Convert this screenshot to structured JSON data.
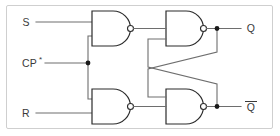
{
  "figure": {
    "type": "logic-circuit-diagram",
    "border_color": "#cfcfcf",
    "wire_color": "#6e6e6e",
    "gate_outline_color": "#2b2b2b",
    "background_color": "#ffffff"
  },
  "inputs": [
    {
      "id": "s",
      "label": "S",
      "x": 26,
      "y": 22
    },
    {
      "id": "cp",
      "label": "CP",
      "suffix": "*",
      "x": 22,
      "y": 65
    },
    {
      "id": "r",
      "label": "R",
      "x": 26,
      "y": 109
    }
  ],
  "outputs": [
    {
      "id": "q",
      "label": "Q",
      "overline": false,
      "x": 251,
      "y": 23
    },
    {
      "id": "qbar",
      "label": "Q",
      "overline": true,
      "x": 251,
      "y": 110
    }
  ],
  "gates": [
    {
      "id": "nand1",
      "type": "NAND",
      "label": "",
      "role": "set-input-gate",
      "x": 92,
      "y": 10
    },
    {
      "id": "nand2",
      "type": "NAND",
      "label": "",
      "role": "reset-input-gate",
      "x": 92,
      "y": 93
    },
    {
      "id": "nand3",
      "type": "NAND",
      "label": "",
      "role": "q-output-gate",
      "x": 166,
      "y": 10
    },
    {
      "id": "nand4",
      "type": "NAND",
      "label": "",
      "role": "qbar-output-gate",
      "x": 166,
      "y": 93
    }
  ],
  "junctions": [
    {
      "id": "cp-branch",
      "x": 88,
      "y": 63
    },
    {
      "id": "q-tap",
      "x": 217,
      "y": 24
    },
    {
      "id": "qbar-tap",
      "x": 217,
      "y": 110
    }
  ],
  "nets": [
    {
      "id": "s-to-nand1",
      "from": "S",
      "to": "NAND1 input A"
    },
    {
      "id": "cp-to-nand1",
      "from": "CP*",
      "to": "NAND1 input B"
    },
    {
      "id": "cp-to-nand2",
      "from": "CP*",
      "to": "NAND2 input A"
    },
    {
      "id": "r-to-nand2",
      "from": "R",
      "to": "NAND2 input B"
    },
    {
      "id": "nand1-to-nand3",
      "from": "NAND1 output",
      "to": "NAND3 input A"
    },
    {
      "id": "nand2-to-nand4",
      "from": "NAND2 output",
      "to": "NAND4 input B"
    },
    {
      "id": "q-feedback",
      "from": "Q",
      "to": "NAND4 input A"
    },
    {
      "id": "qbar-feedback",
      "from": "Q-bar",
      "to": "NAND3 input B"
    },
    {
      "id": "nand3-to-q",
      "from": "NAND3 output",
      "to": "Q"
    },
    {
      "id": "nand4-to-qbar",
      "from": "NAND4 output",
      "to": "Q-bar"
    }
  ],
  "annotations": {
    "clock_star_note": "*",
    "feedback_style": "cross-coupled"
  }
}
